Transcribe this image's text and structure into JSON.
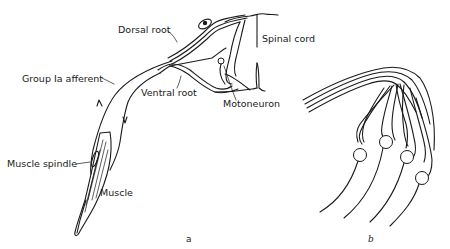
{
  "figure": {
    "panel_a": {
      "sublabel": "a",
      "labels": {
        "dorsal_root": "Dorsal root",
        "spinal_cord": "Spinal cord",
        "group_ia_afferent": "Group Ia afferent",
        "ventral_root": "Ventral root",
        "motoneuron": "Motoneuron",
        "muscle_spindle": "Muscle spindle",
        "muscle": "Muscle"
      }
    },
    "panel_b": {
      "sublabel": "b",
      "cell_count": 4
    },
    "colors": {
      "ink": "#1a1a1a",
      "background": "#ffffff"
    }
  }
}
